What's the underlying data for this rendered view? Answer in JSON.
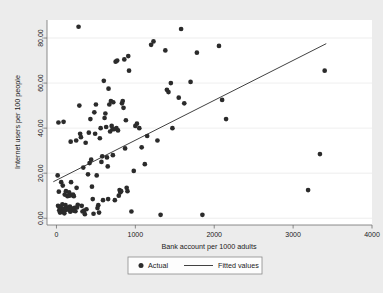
{
  "chart_data": {
    "type": "scatter",
    "title": "",
    "xlabel": "Bank account per 1000 adults",
    "ylabel": "Internet users per 100 people",
    "xlim": [
      -120,
      4000
    ],
    "ylim": [
      -3,
      88
    ],
    "xticks": [
      0,
      1000,
      2000,
      3000,
      4000
    ],
    "xtick_labels": [
      "0",
      "1000",
      "2000",
      "3000",
      "4000"
    ],
    "yticks": [
      0,
      20,
      40,
      60,
      80
    ],
    "ytick_labels": [
      "0.00",
      "20.00",
      "40.00",
      "60.00",
      "80.00"
    ],
    "grid": true,
    "grid_axis": "y",
    "legend_position": "bottom",
    "marker_color": "#2b2b2b",
    "line_color": "#2b2b2b",
    "plot_bg": "#ffffff",
    "figure_bg": "#ececec",
    "series": [
      {
        "name": "Actual",
        "type": "scatter",
        "points": [
          [
            15,
            19.0
          ],
          [
            20,
            5.5
          ],
          [
            25,
            42.5
          ],
          [
            30,
            11.8
          ],
          [
            35,
            3.5
          ],
          [
            40,
            4.8
          ],
          [
            45,
            2.5
          ],
          [
            50,
            3.2
          ],
          [
            55,
            5.0
          ],
          [
            60,
            16.0
          ],
          [
            65,
            4.0
          ],
          [
            70,
            2.8
          ],
          [
            75,
            6.2
          ],
          [
            80,
            14.5
          ],
          [
            85,
            3.0
          ],
          [
            90,
            42.8
          ],
          [
            95,
            4.2
          ],
          [
            100,
            2.2
          ],
          [
            105,
            10.5
          ],
          [
            110,
            3.6
          ],
          [
            115,
            5.8
          ],
          [
            120,
            12.0
          ],
          [
            130,
            4.5
          ],
          [
            140,
            9.8
          ],
          [
            150,
            3.8
          ],
          [
            160,
            11.5
          ],
          [
            165,
            10.0
          ],
          [
            170,
            5.2
          ],
          [
            175,
            2.9
          ],
          [
            180,
            34.0
          ],
          [
            185,
            16.0
          ],
          [
            190,
            4.4
          ],
          [
            200,
            10.2
          ],
          [
            210,
            10.5
          ],
          [
            215,
            3.4
          ],
          [
            220,
            9.8
          ],
          [
            230,
            4.6
          ],
          [
            240,
            3.1
          ],
          [
            250,
            34.5
          ],
          [
            255,
            13.5
          ],
          [
            260,
            4.8
          ],
          [
            270,
            6.0
          ],
          [
            280,
            85.0
          ],
          [
            290,
            50.0
          ],
          [
            300,
            37.5
          ],
          [
            310,
            36.0
          ],
          [
            320,
            5.5
          ],
          [
            330,
            3.0
          ],
          [
            340,
            22.5
          ],
          [
            350,
            3.4
          ],
          [
            360,
            1.8
          ],
          [
            370,
            33.5
          ],
          [
            380,
            4.0
          ],
          [
            400,
            19.5
          ],
          [
            410,
            38.0
          ],
          [
            420,
            24.5
          ],
          [
            430,
            44.0
          ],
          [
            440,
            26.0
          ],
          [
            450,
            14.0
          ],
          [
            460,
            8.5
          ],
          [
            470,
            2.0
          ],
          [
            480,
            47.0
          ],
          [
            490,
            37.5
          ],
          [
            500,
            50.5
          ],
          [
            510,
            19.0
          ],
          [
            520,
            4.5
          ],
          [
            530,
            5.8
          ],
          [
            540,
            2.5
          ],
          [
            550,
            35.5
          ],
          [
            560,
            40.0
          ],
          [
            570,
            25.0
          ],
          [
            580,
            27.5
          ],
          [
            590,
            8.0
          ],
          [
            600,
            61.0
          ],
          [
            610,
            44.5
          ],
          [
            620,
            46.5
          ],
          [
            630,
            40.5
          ],
          [
            640,
            27.0
          ],
          [
            650,
            23.0
          ],
          [
            655,
            8.5
          ],
          [
            660,
            57.5
          ],
          [
            670,
            50.5
          ],
          [
            680,
            38.5
          ],
          [
            690,
            52.0
          ],
          [
            700,
            41.0
          ],
          [
            710,
            39.5
          ],
          [
            715,
            28.0
          ],
          [
            720,
            51.5
          ],
          [
            730,
            39.5
          ],
          [
            740,
            8.0
          ],
          [
            750,
            69.5
          ],
          [
            760,
            40.0
          ],
          [
            770,
            70.0
          ],
          [
            780,
            39.0
          ],
          [
            790,
            10.0
          ],
          [
            800,
            12.5
          ],
          [
            810,
            11.5
          ],
          [
            820,
            12.0
          ],
          [
            830,
            51.0
          ],
          [
            840,
            52.0
          ],
          [
            850,
            49.0
          ],
          [
            860,
            70.5
          ],
          [
            870,
            31.0
          ],
          [
            880,
            43.5
          ],
          [
            890,
            13.5
          ],
          [
            900,
            12.0
          ],
          [
            910,
            72.0
          ],
          [
            920,
            65.5
          ],
          [
            950,
            3.0
          ],
          [
            980,
            21.0
          ],
          [
            1000,
            41.0
          ],
          [
            1020,
            42.0
          ],
          [
            1050,
            40.0
          ],
          [
            1080,
            31.5
          ],
          [
            1120,
            24.0
          ],
          [
            1150,
            36.5
          ],
          [
            1200,
            77.0
          ],
          [
            1230,
            78.5
          ],
          [
            1280,
            34.5
          ],
          [
            1320,
            1.5
          ],
          [
            1380,
            74.5
          ],
          [
            1400,
            57.0
          ],
          [
            1420,
            56.0
          ],
          [
            1450,
            60.0
          ],
          [
            1470,
            40.0
          ],
          [
            1550,
            53.5
          ],
          [
            1580,
            84.0
          ],
          [
            1620,
            51.0
          ],
          [
            1700,
            60.5
          ],
          [
            1780,
            73.5
          ],
          [
            1850,
            1.5
          ],
          [
            2060,
            76.5
          ],
          [
            2100,
            52.5
          ],
          [
            2150,
            44.0
          ],
          [
            3190,
            12.5
          ],
          [
            3340,
            28.5
          ],
          [
            3400,
            65.5
          ]
        ]
      },
      {
        "name": "Fitted values",
        "type": "line",
        "points": [
          [
            -40,
            16.2
          ],
          [
            3420,
            77.5
          ]
        ]
      }
    ],
    "legend_entries": [
      {
        "label": "Actual",
        "marker": "circle"
      },
      {
        "label": "Fitted values",
        "marker": "line"
      }
    ]
  }
}
